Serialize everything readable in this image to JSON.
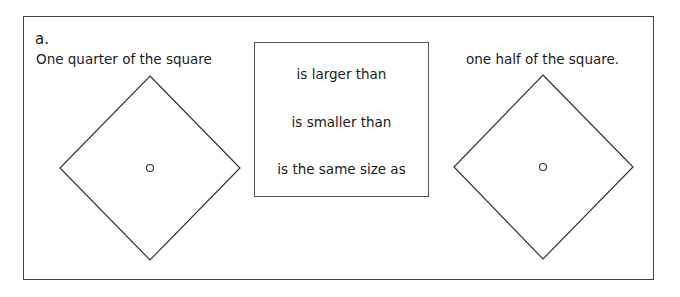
{
  "question": {
    "label": "a.",
    "left_caption": "One quarter of the square",
    "right_caption": "one half of the square.",
    "options": [
      "is larger than",
      "is smaller than",
      "is the same size as"
    ]
  },
  "shapes": {
    "left_diamond": {
      "top": [
        150,
        76
      ],
      "right": [
        240,
        168
      ],
      "bottom": [
        150,
        260
      ],
      "left": [
        60,
        168
      ],
      "center_dot": [
        150,
        168
      ]
    },
    "right_diamond": {
      "top": [
        543,
        75
      ],
      "right": [
        633,
        167
      ],
      "bottom": [
        543,
        259
      ],
      "left": [
        454,
        167
      ],
      "center_dot": [
        543,
        167
      ]
    }
  }
}
